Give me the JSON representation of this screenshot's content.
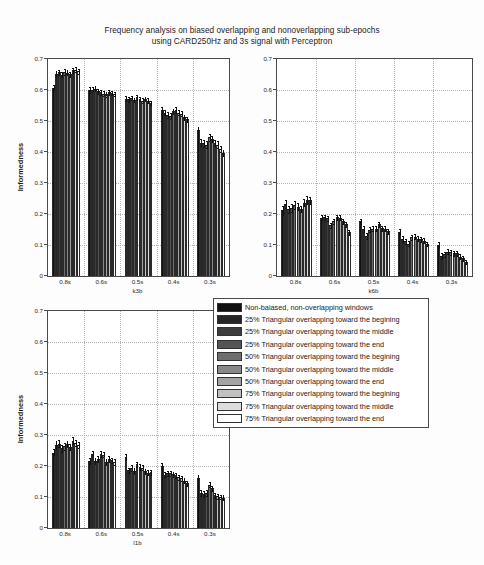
{
  "figure": {
    "title_line1": "Frequency analysis on biased overlapping and nonoverlapping sub-epochs",
    "title_line2": "using CARD250Hz and 3s signal with Perceptron",
    "ylabel": "Informedness",
    "background": "#fdfdfd",
    "axis_color": "#4a4a4a",
    "grid_color": "#b4b4b4"
  },
  "legend": {
    "position": "center-right",
    "entries": [
      {
        "label": "Non-baiased, non-overlapping windows",
        "color": "#111111"
      },
      {
        "label": "25% Triangular overlapping toward the begining",
        "color": "#262626"
      },
      {
        "label": "25% Triangular overlapping toward the middle",
        "color": "#3d3d3d"
      },
      {
        "label": "25% Triangular overlapping toward the end",
        "color": "#545454"
      },
      {
        "label": "50% Triangular overlapping toward the begining",
        "color": "#6e6e6e"
      },
      {
        "label": "50% Triangular overlapping toward the middle",
        "color": "#888888"
      },
      {
        "label": "50% Triangular overlapping toward the end",
        "color": "#a3a3a3"
      },
      {
        "label": "75% Triangular overlapping toward the begining",
        "color": "#c0c0c0"
      },
      {
        "label": "75% Triangular overlapping toward the middle",
        "color": "#dddddd"
      },
      {
        "label": "75% Triangular overlapping toward the end",
        "color": "#ffffff"
      }
    ]
  },
  "chart_data": [
    {
      "id": "k3b",
      "type": "bar",
      "title": "",
      "xlabel": "k3b",
      "ylabel": "Informedness",
      "ylim": [
        0,
        0.7
      ],
      "yticks": [
        "0",
        "0.1",
        "0.2",
        "0.3",
        "0.4",
        "0.5",
        "0.6",
        "0.7"
      ],
      "categories": [
        "0.8s",
        "0.6s",
        "0.5s",
        "0.4s",
        "0.3s"
      ],
      "grid": true,
      "legend_position": "none",
      "series": [
        {
          "name": "Non-baiased, non-overlapping windows",
          "values": [
            0.606,
            0.6,
            0.572,
            0.534,
            0.47
          ]
        },
        {
          "name": "25% Triangular overlapping toward the begining",
          "values": [
            0.652,
            0.601,
            0.57,
            0.527,
            0.43
          ]
        },
        {
          "name": "25% Triangular overlapping toward the middle",
          "values": [
            0.657,
            0.604,
            0.574,
            0.52,
            0.428
          ]
        },
        {
          "name": "25% Triangular overlapping toward the end",
          "values": [
            0.65,
            0.596,
            0.568,
            0.516,
            0.424
          ]
        },
        {
          "name": "50% Triangular overlapping toward the begining",
          "values": [
            0.658,
            0.593,
            0.576,
            0.531,
            0.447
          ]
        },
        {
          "name": "50% Triangular overlapping toward the middle",
          "values": [
            0.655,
            0.588,
            0.572,
            0.536,
            0.442
          ]
        },
        {
          "name": "50% Triangular overlapping toward the end",
          "values": [
            0.651,
            0.586,
            0.566,
            0.527,
            0.43
          ]
        },
        {
          "name": "75% Triangular overlapping toward the begining",
          "values": [
            0.664,
            0.592,
            0.572,
            0.524,
            0.424
          ]
        },
        {
          "name": "75% Triangular overlapping toward the middle",
          "values": [
            0.666,
            0.59,
            0.566,
            0.512,
            0.41
          ]
        },
        {
          "name": "75% Triangular overlapping toward the end",
          "values": [
            0.66,
            0.588,
            0.558,
            0.505,
            0.397
          ]
        }
      ],
      "errors": [
        [
          0.01,
          0.009,
          0.008,
          0.01,
          0.012
        ],
        [
          0.009,
          0.008,
          0.008,
          0.009,
          0.011
        ],
        [
          0.009,
          0.008,
          0.007,
          0.009,
          0.011
        ],
        [
          0.009,
          0.008,
          0.007,
          0.009,
          0.01
        ],
        [
          0.009,
          0.008,
          0.008,
          0.009,
          0.011
        ],
        [
          0.008,
          0.008,
          0.007,
          0.009,
          0.01
        ],
        [
          0.008,
          0.007,
          0.007,
          0.008,
          0.01
        ],
        [
          0.008,
          0.007,
          0.007,
          0.008,
          0.01
        ],
        [
          0.008,
          0.007,
          0.007,
          0.008,
          0.009
        ],
        [
          0.008,
          0.007,
          0.007,
          0.008,
          0.009
        ]
      ]
    },
    {
      "id": "k6b",
      "type": "bar",
      "title": "",
      "xlabel": "k6b",
      "ylabel": "",
      "ylim": [
        0,
        0.7
      ],
      "yticks": [
        "0",
        "0.1",
        "0.2",
        "0.3",
        "0.4",
        "0.5",
        "0.6",
        "0.7"
      ],
      "categories": [
        "0.8s",
        "0.6s",
        "0.5s",
        "0.4s",
        "0.3s"
      ],
      "grid": true,
      "legend_position": "none",
      "series": [
        {
          "name": "Non-baiased, non-overlapping windows",
          "values": [
            0.212,
            0.188,
            0.176,
            0.143,
            0.101
          ]
        },
        {
          "name": "25% Triangular overlapping toward the begining",
          "values": [
            0.231,
            0.189,
            0.152,
            0.12,
            0.065
          ]
        },
        {
          "name": "25% Triangular overlapping toward the middle",
          "values": [
            0.215,
            0.186,
            0.129,
            0.112,
            0.07
          ]
        },
        {
          "name": "25% Triangular overlapping toward the end",
          "values": [
            0.219,
            0.163,
            0.15,
            0.104,
            0.079
          ]
        },
        {
          "name": "50% Triangular overlapping toward the begining",
          "values": [
            0.229,
            0.177,
            0.152,
            0.125,
            0.076
          ]
        },
        {
          "name": "50% Triangular overlapping toward the middle",
          "values": [
            0.223,
            0.189,
            0.153,
            0.127,
            0.073
          ]
        },
        {
          "name": "50% Triangular overlapping toward the end",
          "values": [
            0.216,
            0.188,
            0.167,
            0.12,
            0.073
          ]
        },
        {
          "name": "75% Triangular overlapping toward the begining",
          "values": [
            0.237,
            0.176,
            0.154,
            0.118,
            0.062
          ]
        },
        {
          "name": "75% Triangular overlapping toward the middle",
          "values": [
            0.245,
            0.167,
            0.152,
            0.114,
            0.057
          ]
        },
        {
          "name": "75% Triangular overlapping toward the end",
          "values": [
            0.244,
            0.141,
            0.145,
            0.104,
            0.046
          ]
        }
      ],
      "errors": [
        [
          0.014,
          0.008,
          0.008,
          0.009,
          0.01
        ],
        [
          0.013,
          0.008,
          0.009,
          0.009,
          0.009
        ],
        [
          0.012,
          0.008,
          0.009,
          0.008,
          0.009
        ],
        [
          0.012,
          0.009,
          0.008,
          0.008,
          0.009
        ],
        [
          0.012,
          0.008,
          0.008,
          0.008,
          0.008
        ],
        [
          0.011,
          0.008,
          0.008,
          0.008,
          0.008
        ],
        [
          0.011,
          0.008,
          0.008,
          0.008,
          0.008
        ],
        [
          0.012,
          0.008,
          0.008,
          0.007,
          0.008
        ],
        [
          0.012,
          0.008,
          0.008,
          0.007,
          0.008
        ],
        [
          0.011,
          0.008,
          0.008,
          0.007,
          0.007
        ]
      ]
    },
    {
      "id": "l1b",
      "type": "bar",
      "title": "",
      "xlabel": "l1b",
      "ylabel": "Informedness",
      "ylim": [
        0,
        0.7
      ],
      "yticks": [
        "0",
        "0.1",
        "0.2",
        "0.3",
        "0.4",
        "0.5",
        "0.6",
        "0.7"
      ],
      "categories": [
        "0.8s",
        "0.6s",
        "0.5s",
        "0.4s",
        "0.3s"
      ],
      "grid": true,
      "legend_position": "none",
      "series": [
        {
          "name": "Non-baiased, non-overlapping windows",
          "values": [
            0.243,
            0.215,
            0.23,
            0.2,
            0.16
          ]
        },
        {
          "name": "25% Triangular overlapping toward the begining",
          "values": [
            0.268,
            0.24,
            0.186,
            0.172,
            0.112
          ]
        },
        {
          "name": "25% Triangular overlapping toward the middle",
          "values": [
            0.272,
            0.216,
            0.193,
            0.176,
            0.11
          ]
        },
        {
          "name": "25% Triangular overlapping toward the end",
          "values": [
            0.257,
            0.222,
            0.183,
            0.176,
            0.112
          ]
        },
        {
          "name": "50% Triangular overlapping toward the begining",
          "values": [
            0.264,
            0.239,
            0.205,
            0.174,
            0.14
          ]
        },
        {
          "name": "50% Triangular overlapping toward the middle",
          "values": [
            0.271,
            0.237,
            0.197,
            0.17,
            0.128
          ]
        },
        {
          "name": "50% Triangular overlapping toward the end",
          "values": [
            0.262,
            0.212,
            0.195,
            0.163,
            0.105
          ]
        },
        {
          "name": "75% Triangular overlapping toward the begining",
          "values": [
            0.282,
            0.222,
            0.183,
            0.16,
            0.103
          ]
        },
        {
          "name": "75% Triangular overlapping toward the middle",
          "values": [
            0.274,
            0.218,
            0.178,
            0.152,
            0.1
          ]
        },
        {
          "name": "75% Triangular overlapping toward the end",
          "values": [
            0.268,
            0.213,
            0.18,
            0.145,
            0.097
          ]
        }
      ],
      "errors": [
        [
          0.012,
          0.01,
          0.01,
          0.009,
          0.01
        ],
        [
          0.012,
          0.01,
          0.009,
          0.009,
          0.01
        ],
        [
          0.011,
          0.01,
          0.009,
          0.009,
          0.009
        ],
        [
          0.011,
          0.01,
          0.009,
          0.009,
          0.009
        ],
        [
          0.011,
          0.009,
          0.009,
          0.008,
          0.009
        ],
        [
          0.01,
          0.009,
          0.009,
          0.008,
          0.009
        ],
        [
          0.01,
          0.009,
          0.008,
          0.008,
          0.008
        ],
        [
          0.01,
          0.009,
          0.008,
          0.008,
          0.008
        ],
        [
          0.01,
          0.009,
          0.008,
          0.008,
          0.008
        ],
        [
          0.01,
          0.009,
          0.008,
          0.008,
          0.008
        ]
      ]
    }
  ]
}
